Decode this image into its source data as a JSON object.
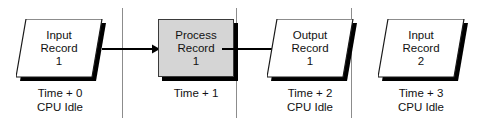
{
  "diagram": {
    "background_color": "#ffffff",
    "line_color": "#000000",
    "divider_color": "#8c8c8c",
    "process_fill_color": "#d5d5d5",
    "record_fill_color": "#ffffff",
    "shadow_color": "#000000"
  },
  "phases": [
    {
      "id": "phase-0",
      "node_type": "parallelogram",
      "node_name": "input-record-1",
      "lines": [
        "Input",
        "Record",
        "1"
      ],
      "caption_lines": [
        "Time + 0",
        "CPU Idle"
      ]
    },
    {
      "id": "phase-1",
      "node_type": "rectangle",
      "node_name": "process-record-1",
      "lines": [
        "Process",
        "Record",
        "1"
      ],
      "caption_lines": [
        "Time + 1"
      ]
    },
    {
      "id": "phase-2",
      "node_type": "parallelogram",
      "node_name": "output-record-1",
      "lines": [
        "Output",
        "Record",
        "1"
      ],
      "caption_lines": [
        "Time + 2",
        "CPU Idle"
      ]
    },
    {
      "id": "phase-3",
      "node_type": "parallelogram",
      "node_name": "input-record-2",
      "lines": [
        "Input",
        "Record",
        "2"
      ],
      "caption_lines": [
        "Time + 3",
        "CPU Idle"
      ]
    }
  ],
  "connectors": [
    {
      "id": "arrow-input1-to-process1",
      "from": "input-record-1",
      "to": "process-record-1"
    },
    {
      "id": "arrow-process1-to-output1",
      "from": "process-record-1",
      "to": "output-record-1"
    }
  ],
  "dividers": [
    {
      "id": "divider-1",
      "after_phase": "phase-0"
    },
    {
      "id": "divider-2",
      "after_phase": "phase-1"
    },
    {
      "id": "divider-3",
      "after_phase": "phase-2"
    }
  ]
}
